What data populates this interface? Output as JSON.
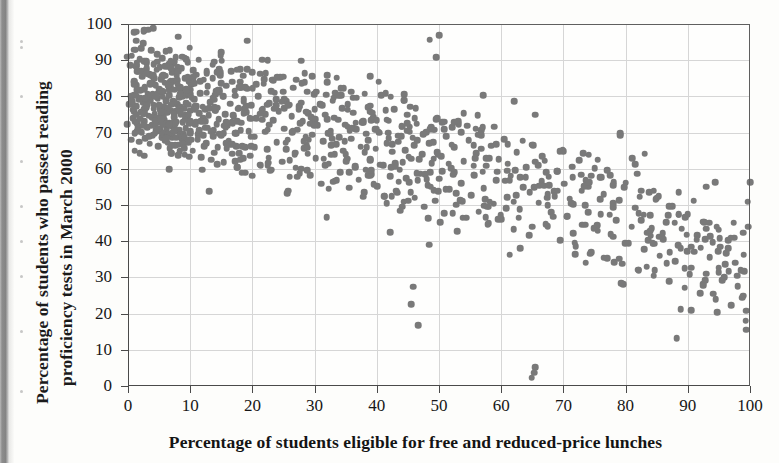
{
  "figure": {
    "top_caption_fragment": "",
    "background_color": "#fdfdfb",
    "dot_color": "#797979",
    "grid_color": "#d6d6d6",
    "axis_color": "#4a4a4a"
  },
  "chart_data": {
    "type": "scatter",
    "title": "",
    "xlabel": "Percentage of students eligible for free and reduced-price lunches",
    "ylabel_line1": "Percentage of students who passed reading",
    "ylabel_line2": "proficiency tests in March 2000",
    "xlim": [
      0,
      100
    ],
    "ylim": [
      0,
      100
    ],
    "xticks": [
      0,
      10,
      20,
      30,
      40,
      50,
      60,
      70,
      80,
      90,
      100
    ],
    "yticks": [
      0,
      10,
      20,
      30,
      40,
      50,
      60,
      70,
      80,
      90,
      100
    ],
    "xtick_labels": [
      "0",
      "10",
      "20",
      "30",
      "40",
      "50",
      "60",
      "70",
      "80",
      "90",
      "100"
    ],
    "ytick_labels": [
      "0",
      "10",
      "20",
      "30",
      "40",
      "50",
      "60",
      "70",
      "80",
      "90",
      "100"
    ],
    "grid": true,
    "legend": null,
    "n_points": 1000,
    "correlation": "strong negative",
    "marker": {
      "shape": "circle",
      "size_px": 6.6,
      "color": "#797979"
    },
    "points": [
      [
        0.4,
        88.6
      ],
      [
        0.6,
        91.2
      ],
      [
        0.8,
        74.0
      ],
      [
        0.9,
        80.5
      ],
      [
        1.0,
        84.2
      ],
      [
        1.1,
        69.8
      ],
      [
        1.2,
        77.4
      ],
      [
        1.3,
        95.4
      ],
      [
        1.4,
        83.1
      ],
      [
        1.5,
        72.6
      ],
      [
        1.6,
        86.9
      ],
      [
        1.7,
        79.2
      ],
      [
        1.8,
        67.5
      ],
      [
        1.9,
        90.3
      ],
      [
        2.0,
        81.7
      ],
      [
        2.1,
        75.8
      ],
      [
        2.2,
        70.1
      ],
      [
        2.3,
        85.4
      ],
      [
        2.4,
        78.3
      ],
      [
        2.5,
        97.9
      ],
      [
        2.6,
        73.2
      ],
      [
        2.7,
        82.6
      ],
      [
        2.8,
        68.4
      ],
      [
        2.9,
        76.9
      ],
      [
        3.0,
        89.1
      ],
      [
        3.1,
        71.5
      ],
      [
        3.2,
        80.8
      ],
      [
        3.3,
        74.7
      ],
      [
        3.4,
        86.2
      ],
      [
        3.5,
        66.9
      ],
      [
        3.6,
        78.9
      ],
      [
        3.7,
        92.8
      ],
      [
        3.8,
        72.1
      ],
      [
        3.9,
        83.6
      ],
      [
        4.0,
        69.3
      ],
      [
        4.1,
        77.7
      ],
      [
        4.2,
        85.0
      ],
      [
        4.3,
        75.2
      ],
      [
        4.4,
        80.1
      ],
      [
        4.5,
        70.6
      ],
      [
        4.6,
        87.4
      ],
      [
        4.7,
        73.8
      ],
      [
        4.8,
        79.5
      ],
      [
        4.9,
        66.2
      ],
      [
        5.0,
        82.0
      ],
      [
        5.1,
        76.4
      ],
      [
        5.2,
        71.0
      ],
      [
        5.3,
        84.8
      ],
      [
        5.4,
        68.7
      ],
      [
        5.5,
        90.6
      ],
      [
        5.6,
        77.1
      ],
      [
        5.7,
        81.3
      ],
      [
        5.8,
        73.5
      ],
      [
        5.9,
        67.8
      ],
      [
        6.0,
        85.7
      ],
      [
        6.1,
        79.0
      ],
      [
        6.2,
        70.9
      ],
      [
        6.3,
        75.6
      ],
      [
        6.4,
        88.2
      ],
      [
        6.5,
        72.4
      ],
      [
        6.6,
        80.4
      ],
      [
        6.7,
        65.7
      ],
      [
        6.8,
        83.9
      ],
      [
        6.9,
        76.1
      ],
      [
        7.0,
        71.7
      ],
      [
        7.1,
        86.5
      ],
      [
        7.2,
        69.0
      ],
      [
        7.3,
        78.6
      ],
      [
        7.4,
        74.3
      ],
      [
        7.5,
        81.9
      ],
      [
        7.6,
        66.5
      ],
      [
        7.7,
        90.9
      ],
      [
        7.8,
        73.0
      ],
      [
        7.9,
        77.9
      ],
      [
        8.0,
        84.4
      ],
      [
        8.1,
        70.3
      ],
      [
        8.2,
        79.7
      ],
      [
        8.3,
        64.8
      ],
      [
        8.4,
        82.3
      ],
      [
        8.5,
        75.0
      ],
      [
        8.6,
        87.8
      ],
      [
        8.7,
        68.1
      ],
      [
        8.8,
        72.9
      ],
      [
        8.9,
        80.7
      ],
      [
        9.0,
        76.6
      ],
      [
        9.1,
        63.9
      ],
      [
        9.2,
        85.1
      ],
      [
        9.3,
        71.2
      ],
      [
        9.4,
        78.1
      ],
      [
        9.5,
        74.1
      ],
      [
        9.6,
        89.5
      ],
      [
        9.7,
        67.2
      ],
      [
        9.8,
        81.1
      ],
      [
        9.9,
        70.0
      ],
      [
        10.0,
        76.0
      ],
      [
        10.2,
        83.3
      ],
      [
        10.4,
        65.0
      ],
      [
        10.6,
        79.3
      ],
      [
        10.8,
        72.2
      ],
      [
        11.0,
        86.0
      ],
      [
        11.2,
        69.6
      ],
      [
        11.4,
        75.4
      ],
      [
        11.6,
        80.9
      ],
      [
        11.8,
        63.2
      ],
      [
        12.0,
        77.2
      ],
      [
        12.2,
        84.6
      ],
      [
        12.4,
        71.4
      ],
      [
        12.6,
        67.0
      ],
      [
        12.8,
        82.8
      ],
      [
        13.0,
        74.8
      ],
      [
        13.2,
        78.4
      ],
      [
        13.4,
        62.5
      ],
      [
        13.6,
        88.8
      ],
      [
        13.8,
        70.7
      ],
      [
        14.0,
        76.2
      ],
      [
        14.2,
        81.5
      ],
      [
        14.4,
        66.0
      ],
      [
        14.6,
        73.7
      ],
      [
        14.8,
        85.8
      ],
      [
        15.0,
        69.2
      ],
      [
        15.2,
        79.9
      ],
      [
        15.4,
        61.8
      ],
      [
        15.6,
        75.1
      ],
      [
        15.8,
        83.0
      ],
      [
        16.0,
        71.9
      ],
      [
        16.2,
        67.6
      ],
      [
        16.4,
        78.0
      ],
      [
        16.6,
        87.0
      ],
      [
        16.8,
        64.2
      ],
      [
        17.0,
        74.4
      ],
      [
        17.2,
        80.2
      ],
      [
        17.4,
        69.9
      ],
      [
        17.6,
        60.5
      ],
      [
        17.8,
        76.8
      ],
      [
        18.0,
        84.1
      ],
      [
        18.2,
        72.7
      ],
      [
        18.4,
        66.3
      ],
      [
        18.6,
        79.4
      ],
      [
        18.8,
        58.9
      ],
      [
        19.0,
        75.7
      ],
      [
        19.2,
        82.1
      ],
      [
        19.4,
        70.4
      ],
      [
        19.6,
        63.6
      ],
      [
        19.8,
        77.6
      ],
      [
        20.0,
        86.7
      ],
      [
        20.3,
        68.9
      ],
      [
        20.6,
        74.0
      ],
      [
        20.9,
        80.0
      ],
      [
        21.2,
        61.1
      ],
      [
        21.5,
        76.3
      ],
      [
        21.8,
        83.5
      ],
      [
        22.1,
        70.2
      ],
      [
        22.4,
        65.4
      ],
      [
        22.7,
        78.2
      ],
      [
        23.0,
        59.7
      ],
      [
        23.3,
        73.4
      ],
      [
        23.6,
        81.0
      ],
      [
        23.9,
        67.3
      ],
      [
        24.2,
        75.9
      ],
      [
        24.5,
        85.3
      ],
      [
        24.8,
        62.0
      ],
      [
        25.1,
        71.1
      ],
      [
        25.4,
        78.7
      ],
      [
        25.7,
        68.0
      ],
      [
        26.0,
        57.8
      ],
      [
        26.3,
        74.6
      ],
      [
        26.6,
        82.4
      ],
      [
        26.9,
        64.5
      ],
      [
        27.2,
        70.8
      ],
      [
        27.5,
        77.3
      ],
      [
        27.8,
        60.0
      ],
      [
        28.1,
        73.1
      ],
      [
        28.4,
        86.4
      ],
      [
        28.7,
        66.6
      ],
      [
        29.0,
        75.3
      ],
      [
        29.3,
        58.2
      ],
      [
        29.6,
        69.4
      ],
      [
        29.9,
        80.6
      ],
      [
        30.2,
        63.0
      ],
      [
        30.5,
        72.0
      ],
      [
        30.8,
        77.8
      ],
      [
        31.1,
        55.9
      ],
      [
        31.4,
        67.7
      ],
      [
        31.7,
        74.9
      ],
      [
        32.0,
        84.0
      ],
      [
        32.3,
        61.4
      ],
      [
        32.6,
        70.5
      ],
      [
        32.9,
        78.8
      ],
      [
        33.2,
        56.7
      ],
      [
        33.5,
        66.8
      ],
      [
        33.8,
        73.6
      ],
      [
        34.1,
        59.1
      ],
      [
        34.4,
        76.7
      ],
      [
        34.7,
        82.2
      ],
      [
        35.0,
        64.0
      ],
      [
        35.3,
        71.6
      ],
      [
        35.6,
        54.8
      ],
      [
        35.9,
        68.3
      ],
      [
        36.2,
        75.5
      ],
      [
        36.5,
        60.7
      ],
      [
        36.8,
        79.6
      ],
      [
        37.1,
        57.0
      ],
      [
        37.4,
        66.1
      ],
      [
        37.7,
        72.8
      ],
      [
        38.0,
        53.6
      ],
      [
        38.3,
        69.7
      ],
      [
        38.6,
        77.0
      ],
      [
        38.9,
        62.3
      ],
      [
        39.2,
        58.5
      ],
      [
        39.5,
        74.2
      ],
      [
        39.8,
        65.6
      ],
      [
        40.1,
        55.2
      ],
      [
        40.4,
        70.0
      ],
      [
        40.7,
        80.3
      ],
      [
        41.0,
        61.0
      ],
      [
        41.3,
        52.4
      ],
      [
        41.6,
        67.1
      ],
      [
        41.9,
        73.3
      ],
      [
        42.2,
        58.0
      ],
      [
        42.5,
        64.7
      ],
      [
        42.8,
        76.5
      ],
      [
        43.1,
        54.0
      ],
      [
        43.4,
        69.1
      ],
      [
        43.7,
        59.8
      ],
      [
        44.0,
        71.8
      ],
      [
        44.3,
        50.9
      ],
      [
        44.6,
        65.2
      ],
      [
        44.9,
        75.0
      ],
      [
        45.2,
        56.3
      ],
      [
        45.5,
        62.8
      ],
      [
        45.8,
        68.6
      ],
      [
        46.1,
        52.0
      ],
      [
        46.4,
        72.5
      ],
      [
        46.7,
        16.8
      ],
      [
        47.0,
        58.7
      ],
      [
        47.3,
        64.1
      ],
      [
        47.6,
        49.5
      ],
      [
        47.9,
        70.1
      ],
      [
        48.2,
        55.5
      ],
      [
        48.5,
        95.7
      ],
      [
        48.8,
        61.6
      ],
      [
        49.1,
        67.4
      ],
      [
        49.4,
        51.2
      ],
      [
        49.7,
        73.9
      ],
      [
        50.0,
        57.3
      ],
      [
        50.4,
        63.4
      ],
      [
        50.8,
        47.8
      ],
      [
        51.2,
        69.0
      ],
      [
        51.6,
        54.3
      ],
      [
        52.0,
        60.2
      ],
      [
        52.4,
        66.0
      ],
      [
        52.8,
        50.1
      ],
      [
        53.2,
        72.3
      ],
      [
        53.6,
        56.0
      ],
      [
        54.0,
        62.1
      ],
      [
        54.4,
        46.5
      ],
      [
        54.8,
        67.9
      ],
      [
        55.2,
        52.7
      ],
      [
        55.6,
        58.4
      ],
      [
        56.0,
        64.3
      ],
      [
        56.4,
        48.2
      ],
      [
        56.8,
        70.6
      ],
      [
        57.2,
        54.6
      ],
      [
        57.6,
        60.9
      ],
      [
        58.0,
        44.9
      ],
      [
        58.4,
        66.4
      ],
      [
        58.8,
        50.4
      ],
      [
        59.2,
        56.8
      ],
      [
        59.6,
        62.6
      ],
      [
        60.0,
        46.0
      ],
      [
        60.5,
        68.2
      ],
      [
        61.0,
        52.1
      ],
      [
        61.5,
        58.1
      ],
      [
        62.0,
        43.3
      ],
      [
        62.5,
        64.6
      ],
      [
        63.0,
        48.8
      ],
      [
        63.5,
        54.9
      ],
      [
        64.0,
        60.4
      ],
      [
        64.5,
        41.7
      ],
      [
        65.0,
        66.7
      ],
      [
        65.5,
        5.2
      ],
      [
        66.0,
        50.6
      ],
      [
        66.5,
        56.5
      ],
      [
        67.0,
        62.2
      ],
      [
        67.5,
        44.1
      ],
      [
        68.0,
        48.0
      ],
      [
        68.5,
        53.8
      ],
      [
        69.0,
        59.3
      ],
      [
        69.5,
        40.2
      ],
      [
        70.0,
        64.9
      ],
      [
        70.5,
        46.8
      ],
      [
        71.0,
        51.7
      ],
      [
        71.5,
        57.6
      ],
      [
        72.0,
        38.6
      ],
      [
        72.5,
        62.4
      ],
      [
        73.0,
        44.6
      ],
      [
        73.5,
        49.9
      ],
      [
        74.0,
        55.1
      ],
      [
        74.5,
        36.9
      ],
      [
        75.0,
        60.1
      ],
      [
        75.5,
        42.9
      ],
      [
        76.0,
        47.4
      ],
      [
        76.5,
        53.0
      ],
      [
        77.0,
        35.3
      ],
      [
        77.5,
        58.3
      ],
      [
        78.0,
        41.2
      ],
      [
        78.5,
        45.8
      ],
      [
        79.0,
        51.4
      ],
      [
        79.5,
        33.8
      ],
      [
        80.0,
        56.2
      ],
      [
        80.5,
        39.5
      ],
      [
        81.0,
        44.0
      ],
      [
        81.5,
        49.2
      ],
      [
        82.0,
        32.1
      ],
      [
        82.5,
        54.0
      ],
      [
        83.0,
        37.8
      ],
      [
        83.5,
        42.3
      ],
      [
        84.0,
        47.1
      ],
      [
        84.5,
        30.5
      ],
      [
        85.0,
        51.9
      ],
      [
        85.5,
        36.0
      ],
      [
        86.0,
        40.6
      ],
      [
        86.5,
        45.2
      ],
      [
        87.0,
        28.9
      ],
      [
        87.5,
        49.6
      ],
      [
        88.0,
        34.4
      ],
      [
        88.5,
        38.9
      ],
      [
        89.0,
        43.4
      ],
      [
        89.5,
        27.2
      ],
      [
        90.0,
        47.5
      ],
      [
        90.5,
        32.7
      ],
      [
        91.0,
        37.1
      ],
      [
        91.5,
        41.6
      ],
      [
        92.0,
        25.6
      ],
      [
        92.5,
        45.4
      ],
      [
        93.0,
        31.0
      ],
      [
        93.5,
        35.5
      ],
      [
        94.0,
        39.8
      ],
      [
        94.5,
        24.0
      ],
      [
        95.0,
        43.2
      ],
      [
        95.5,
        29.3
      ],
      [
        96.0,
        33.7
      ],
      [
        96.5,
        38.0
      ],
      [
        97.0,
        22.4
      ],
      [
        97.5,
        41.0
      ],
      [
        98.0,
        27.6
      ],
      [
        98.5,
        32.0
      ],
      [
        99.0,
        36.3
      ],
      [
        99.4,
        20.8
      ],
      [
        99.6,
        50.9
      ],
      [
        99.7,
        44.0
      ]
    ]
  }
}
